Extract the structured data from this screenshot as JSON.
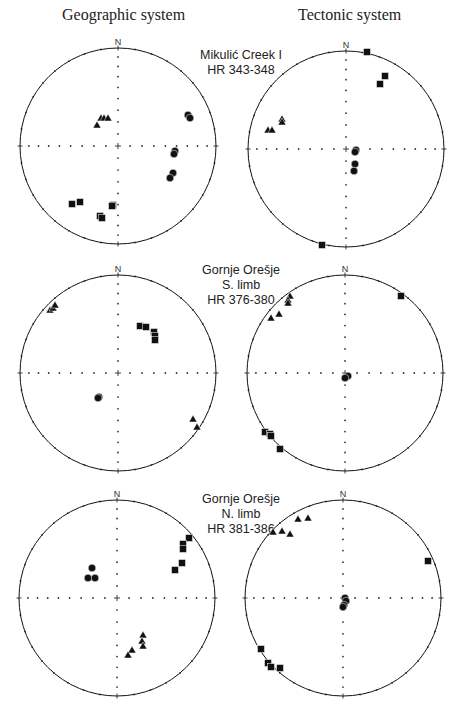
{
  "headers": {
    "geographic": "Geographic system",
    "tectonic": "Tectonic system"
  },
  "north_label": "N",
  "sites": [
    {
      "name": "Mikulić Creek I",
      "limb": "",
      "samples": "HR 343-348"
    },
    {
      "name": "Gornje Orešje",
      "limb": "S. limb",
      "samples": "HR 376-380"
    },
    {
      "name": "Gornje Orešje",
      "limb": "N. limb",
      "samples": "HR 381-386"
    }
  ],
  "style": {
    "ink": "#111111",
    "grid_dot": "#333333"
  },
  "chart_data": {
    "type": "scatter",
    "legend": {
      "square": "max axis",
      "triangle": "intermediate axis",
      "circle": "min axis"
    },
    "nets": [
      {
        "id": "mikulic-geo",
        "cx": 118,
        "cy": 146,
        "r": 98,
        "triangles": [
          [
            -21,
            -21
          ],
          [
            -17,
            -28
          ],
          [
            -14,
            -28
          ],
          [
            -10,
            -28
          ]
        ],
        "circles": [
          [
            70,
            -31
          ],
          [
            72,
            -28
          ],
          [
            57,
            5
          ],
          [
            56,
            8
          ],
          [
            55,
            27
          ],
          [
            52,
            32
          ]
        ],
        "squares": [
          [
            -46,
            58
          ],
          [
            -38,
            56
          ],
          [
            -18,
            70
          ],
          [
            -16,
            72
          ],
          [
            -5,
            59
          ],
          [
            -6,
            60
          ]
        ]
      },
      {
        "id": "mikulic-tec",
        "cx": 346,
        "cy": 149,
        "r": 98,
        "triangles": [
          [
            -64,
            -30
          ],
          [
            -64,
            -27
          ],
          [
            -78,
            -19
          ],
          [
            -74,
            -19
          ]
        ],
        "circles": [
          [
            10,
            1
          ],
          [
            9,
            3
          ],
          [
            9,
            15
          ],
          [
            8,
            22
          ]
        ],
        "squares": [
          [
            21,
            -97
          ],
          [
            39,
            -73
          ],
          [
            34,
            -65
          ],
          [
            -24,
            96
          ]
        ]
      },
      {
        "id": "oresje-s-geo",
        "cx": 118,
        "cy": 373,
        "r": 98,
        "triangles": [
          [
            -68,
            -63
          ],
          [
            -65,
            -65
          ],
          [
            -63,
            -68
          ],
          [
            75,
            46
          ],
          [
            79,
            54
          ]
        ],
        "circles": [
          [
            -19,
            24
          ],
          [
            -20,
            25
          ]
        ],
        "squares": [
          [
            22,
            -47
          ],
          [
            28,
            -46
          ],
          [
            36,
            -41
          ],
          [
            37,
            -37
          ],
          [
            37,
            -33
          ]
        ]
      },
      {
        "id": "oresje-s-tec",
        "cx": 345,
        "cy": 373,
        "r": 98,
        "triangles": [
          [
            -55,
            -77
          ],
          [
            -57,
            -73
          ],
          [
            -57,
            -70
          ],
          [
            -66,
            -59
          ],
          [
            -74,
            -55
          ]
        ],
        "circles": [
          [
            3,
            3
          ],
          [
            0,
            5
          ]
        ],
        "squares": [
          [
            56,
            -77
          ],
          [
            -80,
            59
          ],
          [
            -75,
            61
          ],
          [
            -74,
            63
          ],
          [
            -65,
            76
          ]
        ]
      },
      {
        "id": "oresje-n-geo",
        "cx": 117,
        "cy": 598,
        "r": 98,
        "triangles": [
          [
            26,
            37
          ],
          [
            25,
            43
          ],
          [
            26,
            48
          ],
          [
            15,
            52
          ],
          [
            11,
            57
          ]
        ],
        "circles": [
          [
            -25,
            -30
          ],
          [
            -29,
            -20
          ],
          [
            -22,
            -20
          ]
        ],
        "squares": [
          [
            72,
            -60
          ],
          [
            66,
            -54
          ],
          [
            66,
            -49
          ],
          [
            65,
            -35
          ],
          [
            58,
            -28
          ]
        ]
      },
      {
        "id": "oresje-n-tec",
        "cx": 343,
        "cy": 598,
        "r": 98,
        "triangles": [
          [
            -45,
            -79
          ],
          [
            -35,
            -80
          ],
          [
            -70,
            -66
          ],
          [
            -61,
            -67
          ],
          [
            -53,
            -64
          ]
        ],
        "circles": [
          [
            2,
            0
          ],
          [
            3,
            3
          ],
          [
            1,
            7
          ],
          [
            0,
            9
          ]
        ],
        "squares": [
          [
            85,
            -37
          ],
          [
            -82,
            51
          ],
          [
            -75,
            65
          ],
          [
            -72,
            69
          ],
          [
            -63,
            70
          ]
        ]
      }
    ]
  }
}
